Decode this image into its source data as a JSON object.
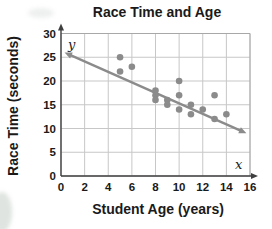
{
  "chart_data": {
    "type": "scatter",
    "title": "Race Time and Age",
    "xlabel": "Student Age (years)",
    "ylabel": "Race Time (seconds)",
    "axis_letters": {
      "x": "x",
      "y": "y"
    },
    "xlim": [
      0,
      16
    ],
    "ylim": [
      0,
      30
    ],
    "x_ticks": [
      0,
      2,
      4,
      6,
      8,
      10,
      12,
      14,
      16
    ],
    "y_ticks": [
      0,
      5,
      10,
      15,
      20,
      25,
      30
    ],
    "grid": true,
    "legend": false,
    "points": [
      [
        5,
        25
      ],
      [
        5,
        22
      ],
      [
        6,
        23
      ],
      [
        8,
        18
      ],
      [
        8,
        17
      ],
      [
        8,
        16
      ],
      [
        9,
        16
      ],
      [
        9,
        15
      ],
      [
        10,
        20
      ],
      [
        10,
        17
      ],
      [
        10,
        14
      ],
      [
        11,
        15
      ],
      [
        11,
        13
      ],
      [
        12,
        14
      ],
      [
        13,
        17
      ],
      [
        13,
        12
      ],
      [
        14,
        13
      ]
    ],
    "trend_line": {
      "x1": 0.3,
      "y1": 26,
      "x2": 15.7,
      "y2": 9,
      "arrows": "both"
    },
    "colors": {
      "dot": "#8b8b8b",
      "trend": "#8b8b8b",
      "grid": "#c7c7c7",
      "frame": "#a8a8a8",
      "axis": "#3f3f3f",
      "text": "#1a1a1a"
    }
  }
}
